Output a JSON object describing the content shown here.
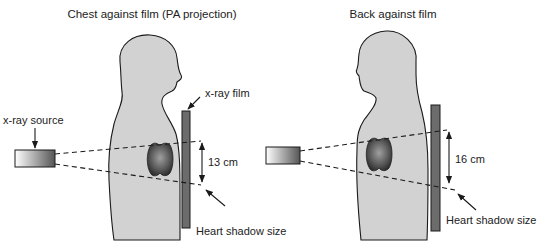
{
  "figure": {
    "left_panel": {
      "title": "Chest against film (PA projection)",
      "labels": {
        "source": "x-ray source",
        "film": "x-ray film",
        "measurement": "13 cm",
        "shadow": "Heart shadow size"
      }
    },
    "right_panel": {
      "title": "Back against film",
      "labels": {
        "measurement": "16 cm",
        "shadow": "Heart shadow size"
      }
    }
  },
  "colors": {
    "body_fill": "#d2d2d2",
    "film_fill": "#6c6c6c",
    "heart_dark": "#2e2e2e",
    "heart_light": "#9a9a9a",
    "outline": "#1a1a1a"
  }
}
